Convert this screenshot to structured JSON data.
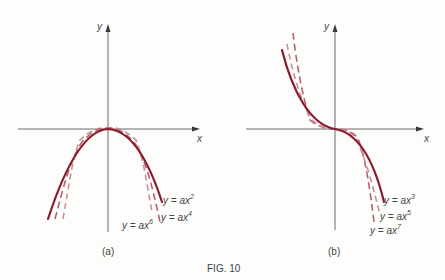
{
  "figure": {
    "caption": "FIG. 10",
    "panels": [
      {
        "id": "a",
        "label": "(a)",
        "x_axis_label": "x",
        "y_axis_label": "y",
        "curves": [
          {
            "name": "y = ax",
            "exponent": "2",
            "style": "solid"
          },
          {
            "name": "y = ax",
            "exponent": "4",
            "style": "dashed"
          },
          {
            "name": "y = ax",
            "exponent": "6",
            "style": "dashed"
          }
        ]
      },
      {
        "id": "b",
        "label": "(b)",
        "x_axis_label": "x",
        "y_axis_label": "y",
        "curves": [
          {
            "name": "y = ax",
            "exponent": "3",
            "style": "solid"
          },
          {
            "name": "y = ax",
            "exponent": "5",
            "style": "dashed"
          },
          {
            "name": "y = ax",
            "exponent": "7",
            "style": "dashed"
          }
        ]
      }
    ],
    "colors": {
      "solid_curve": "#8b1a2b",
      "dashed_curve_1": "#b5626f",
      "dashed_curve_2": "#c9909a",
      "axis": "#6a6a6a"
    }
  }
}
